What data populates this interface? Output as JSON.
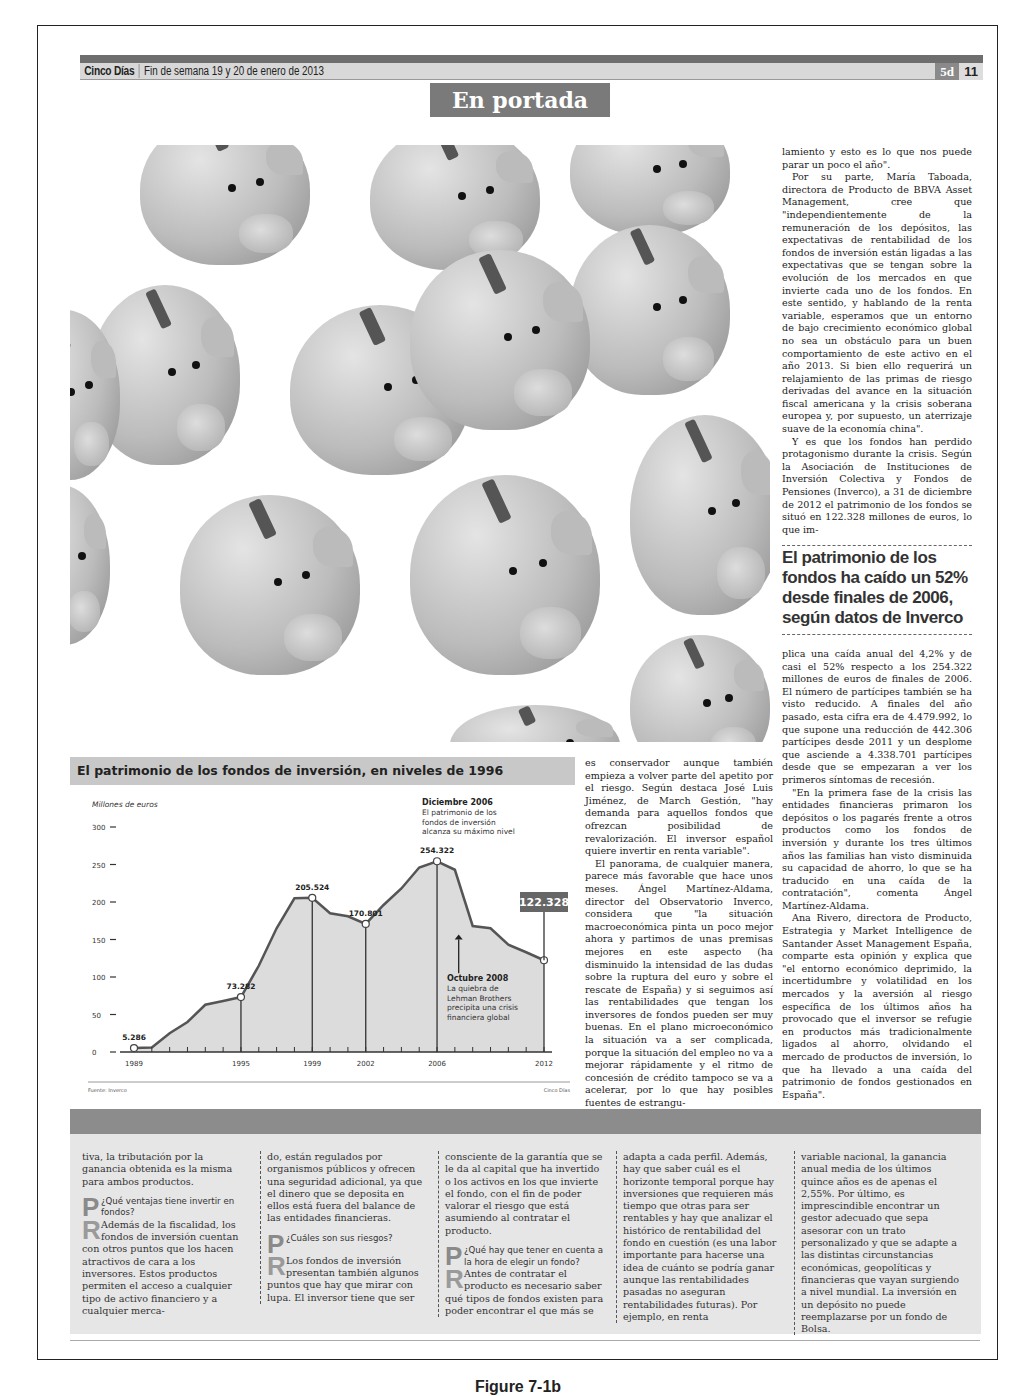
{
  "masthead": {
    "brand": "Cinco Días",
    "date": "Fin de semana 19 y 20 de enero de 2013",
    "section_code": "5d",
    "page_number": "11"
  },
  "section_title": "En portada",
  "photo": {
    "description": "Piggy banks pattern illustration"
  },
  "right_column_top": [
    "lamiento y esto es lo que nos puede parar un poco el año\".",
    "Por su parte, María Taboada, directora de Producto de BBVA Asset Management, cree que \"independientemente de la remuneración de los depósitos, las expectativas de rentabilidad de los fondos de inversión están ligadas a las expectativas que se tengan sobre la evolución de los mercados en que invierte cada uno de los fondos. En este sentido, y hablando de la renta variable, esperamos que un entorno de bajo crecimiento económico global no sea un obstáculo para un buen comportamiento de este activo en el año 2013. Si bien ello requerirá un relajamiento de las primas de riesgo derivadas del avance en la situación fiscal americana y la crisis soberana europea y, por supuesto, un aterrizaje suave de la economía china\".",
    "Y es que los fondos han perdido protagonismo durante la crisis. Según la Asociación de Instituciones de Inversión Colectiva y Fondos de Pensiones (Inverco), a 31 de diciembre de 2012 el patrimonio de los fondos se situó en 122.328 millones de euros, lo que im-"
  ],
  "headline": "El patrimonio de los fondos ha caído un 52% desde finales de 2006, según datos de Inverco",
  "right_column_bottom": [
    "plica una caída anual del 4,2% y de casi el 52% respecto a los 254.322 millones de euros de finales de 2006. El número de partícipes también se ha visto reducido. A finales del año pasado, esta cifra era de 4.479.992, lo que supone una reducción de 442.306 partícipes desde 2011 y un desplome que asciende a 4.338.701 partícipes desde que se empezaran a ver los primeros síntomas de recesión.",
    "\"En la primera fase de la crisis las entidades financieras primaron los depósitos o los pagarés frente a otros productos como los fondos de inversión y durante los tres últimos años las familias han visto disminuida su capacidad de ahorro, lo que se ha traducido en una caída de la contratación\", comenta Ángel Martínez-Aldama.",
    "Ana Rivero, directora de Producto, Estrategia y Market Intelligence de Santander Asset Management España, comparte esta opinión y explica que \"el entorno económico deprimido, la incertidumbre y volatilidad en los mercados y la aversión al riesgo específica de los últimos años ha provocado que el inversor se refugie en productos más tradicionalmente ligados al ahorro, olvidando el mercado de productos de inversión, lo que ha llevado a una caída del patrimonio de fondos gestionados en España\"."
  ],
  "middle_column": [
    "es conservador aunque también empieza a volver parte del apetito por el riesgo. Según destaca José Luis Jiménez, de March Gestión, \"hay demanda para aquellos fondos que ofrezcan posibilidad de revalorización. El inversor español quiere invertir en renta variable\".",
    "El panorama, de cualquier manera, parece más favorable que hace unos meses. Ángel Martínez-Aldama, director del Observatorio Inverco, considera que \"la situación macroeconómica pinta un poco mejor ahora y partimos de unas premisas mejores en este aspecto (ha disminuido la intensidad de las dudas sobre la ruptura del euro y sobre el rescate de España) y si seguimos así las rentabilidades que tengan los inversores de fondos pueden ser muy buenas. En el plano microeconómico la situación va a ser complicada, porque la situación del empleo no va a mejorar rápidamente y el ritmo de concesión de crédito tampoco se va a acelerar, por lo que hay posibles fuentes de estrangu-"
  ],
  "chart_data": {
    "type": "area",
    "title": "El patrimonio de los fondos de inversión, en niveles de 1996",
    "ylabel": "Millones de euros",
    "xlabel": "",
    "ylim": [
      0,
      300
    ],
    "yticks": [
      0,
      50,
      100,
      150,
      200,
      250,
      300
    ],
    "xtick_labels": [
      "1989",
      "1995",
      "1999",
      "2002",
      "2006",
      "2012"
    ],
    "x": [
      1989,
      1990,
      1991,
      1992,
      1993,
      1994,
      1995,
      1996,
      1997,
      1998,
      1999,
      2000,
      2001,
      2002,
      2003,
      2004,
      2005,
      2006,
      2007,
      2008,
      2009,
      2010,
      2011,
      2012
    ],
    "values": [
      5.286,
      6,
      25,
      40,
      63,
      68,
      73.282,
      115,
      165,
      205,
      205.524,
      185,
      181,
      170.801,
      196,
      218,
      246,
      254.322,
      243,
      168,
      165,
      143,
      133,
      122.328
    ],
    "labeled_points": [
      {
        "x": 1989,
        "label": "5.286"
      },
      {
        "x": 1995,
        "label": "73.282"
      },
      {
        "x": 1999,
        "label": "205.524"
      },
      {
        "x": 2002,
        "label": "170.801"
      },
      {
        "x": 2006,
        "label": "254.322"
      },
      {
        "x": 2012,
        "label": "122.328",
        "highlight": true
      }
    ],
    "annotations": [
      {
        "title": "Diciembre 2006",
        "text": "El patrimonio de los fondos de inversión alcanza su máximo nivel"
      },
      {
        "title": "Octubre 2008",
        "text": "La quiebra de Lehman Brothers precipita una crisis financiera global"
      }
    ],
    "source": "Fuente: Inverco",
    "credit": "Cinco Días",
    "grid": false,
    "legend": "none"
  },
  "bottom_panel": {
    "columns": [
      {
        "lead": "tiva, la tributación por la ganancia obtenida es la misma para ambos productos.",
        "question": "¿Qué ventajas tiene invertir en fondos?",
        "answer": "Además de la fiscalidad, los fondos de inversión cuentan con otros puntos que los hacen atractivos de cara a los inversores. Estos productos permiten el acceso a cualquier tipo de activo financiero y a cualquier merca-"
      },
      {
        "lead": "do, están regulados por organismos públicos y ofrecen una seguridad adicional, ya que el dinero que se deposita en ellos está fuera del balance de las entidades financieras.",
        "question": "¿Cuáles son sus riesgos?",
        "answer": "Los fondos de inversión presentan también algunos puntos que hay que mirar con lupa. El inversor tiene que ser"
      },
      {
        "lead": "consciente de la garantía que se le da al capital que ha invertido o los activos en los que invierte el fondo, con el fin de poder valorar el riesgo que está asumiendo al contratar el producto.",
        "question": "¿Qué hay que tener en cuenta a la hora de elegir un fondo?",
        "answer": "Antes de contratar el producto es necesario saber qué tipos de fondos existen para poder encontrar el que más se"
      },
      {
        "lead": "adapta a cada perfil. Además, hay que saber cuál es el horizonte temporal porque hay inversiones que requieren más tiempo que otras para ser rentables y hay que analizar el histórico de rentabilidad del fondo en cuestión (es una labor importante para hacerse una idea de cuánto se podría ganar aunque las rentabilidades pasadas no aseguran rentabilidades futuras). Por ejemplo, en renta"
      },
      {
        "lead": "variable nacional, la ganancia anual media de los últimos quince años es de apenas el 2,55%. Por último, es imprescindible encontrar un gestor adecuado que sepa asesorar con un trato personalizado y que se adapte a las distintas circunstancias económicas, geopolíticas y financieras que vayan surgiendo a nivel mundial. La inversión en un depósito no puede reemplazarse por un fondo de Bolsa."
      }
    ],
    "dropcap_q": "P",
    "dropcap_a": "R"
  },
  "figure_caption": "Figure 7-1b"
}
